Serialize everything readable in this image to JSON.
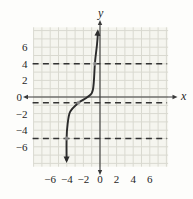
{
  "figure": {
    "xlabel": "x",
    "ylabel": "y"
  },
  "colors": {
    "paper": "#fdfdfb",
    "grid_fill": "#f5f5ef",
    "grid_line": "#d9d9d0",
    "axis": "#3a3a3a",
    "curve": "#2b2b2b",
    "dashed_line": "#333333",
    "dot": "#9b9b9b",
    "text": "#1f1f1f"
  },
  "chart_data": {
    "type": "line",
    "title": "",
    "xlabel": "x",
    "ylabel": "y",
    "xlim": [
      -8,
      8.2
    ],
    "ylim": [
      -8.4,
      8.4
    ],
    "grid": true,
    "grid_step": 1,
    "x_ticks": [
      -6,
      -4,
      -2,
      0,
      2,
      4,
      6
    ],
    "y_ticks": [
      6,
      4,
      2,
      0,
      -2,
      -4,
      -6
    ],
    "legend": false,
    "series": [
      {
        "name": "increasing-s-curve",
        "type": "curve",
        "arrow_start": "down",
        "arrow_end": "up",
        "points": [
          [
            -4.02,
            -7.6
          ],
          [
            -4.03,
            -5.0
          ],
          [
            -3.9,
            -3.3
          ],
          [
            -3.6,
            -1.8
          ],
          [
            -2.65,
            -0.75
          ],
          [
            -1.5,
            0.0
          ],
          [
            -0.85,
            0.85
          ],
          [
            -0.6,
            4.2
          ],
          [
            -0.36,
            6.3
          ],
          [
            -0.25,
            7.8
          ]
        ]
      },
      {
        "name": "horizontal-dashed-line-top",
        "type": "hline",
        "y": 4
      },
      {
        "name": "horizontal-dashed-line-middle",
        "type": "hline",
        "y": -0.7
      },
      {
        "name": "horizontal-dashed-line-bottom",
        "type": "hline",
        "y": -5
      }
    ],
    "points_of_interest": [
      [
        -0.63,
        4
      ],
      [
        -2.6,
        -0.7
      ],
      [
        -4.03,
        -5
      ]
    ]
  }
}
